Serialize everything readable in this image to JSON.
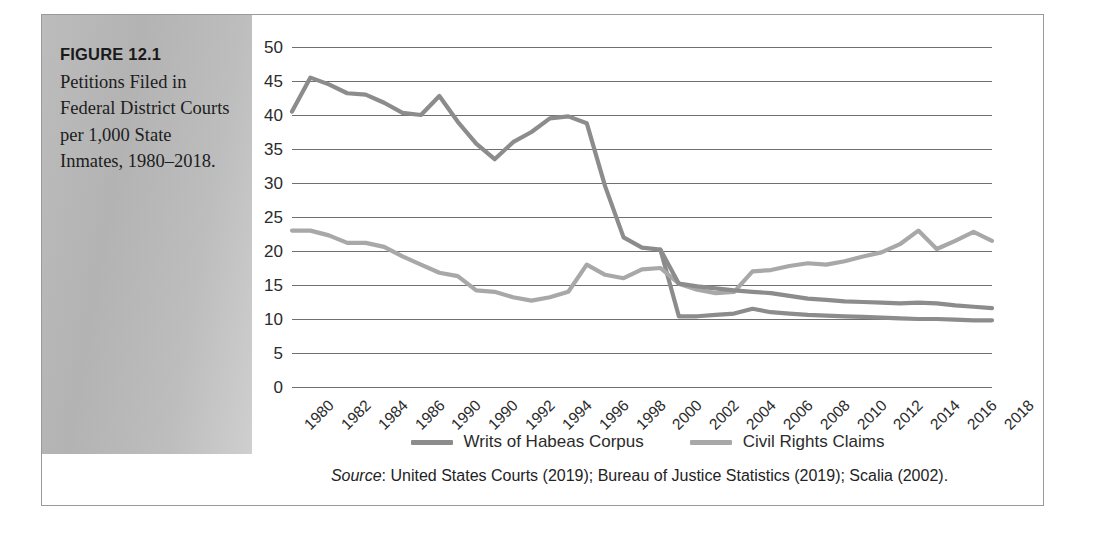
{
  "figure": {
    "number": "FIGURE 12.1",
    "caption": "Petitions Filed in Federal District Courts per 1,000 State Inmates, 1980–2018."
  },
  "source": {
    "label": "Source",
    "text": ": United States Courts (2019); Bureau of Justice Statistics (2019); Scalia (2002)."
  },
  "colors": {
    "habeas": "#8c8c8c",
    "civil_rights": "#a8a8a8",
    "gridline": "#6f6f6f",
    "panel_gray": "#b8b8b8",
    "frame": "#9a9a9a",
    "text": "#2b2b2b"
  },
  "chart_data": {
    "type": "line",
    "xlabel": "",
    "ylabel": "",
    "ylim": [
      0,
      50
    ],
    "ytick_step": 5,
    "yticks": [
      50,
      45,
      40,
      35,
      30,
      25,
      20,
      15,
      10,
      5,
      0
    ],
    "grid": true,
    "legend_position": "bottom",
    "x": [
      1980,
      1981,
      1982,
      1983,
      1984,
      1985,
      1986,
      1987,
      1988,
      1989,
      1990,
      1991,
      1992,
      1993,
      1994,
      1995,
      1996,
      1997,
      1998,
      1999,
      2000,
      2001,
      2002,
      2003,
      2004,
      2005,
      2006,
      2007,
      2008,
      2009,
      2010,
      2011,
      2012,
      2013,
      2014,
      2015,
      2016,
      2017,
      2018
    ],
    "xtick_labels": [
      "1980",
      "1982",
      "1984",
      "1986",
      "1990",
      "1990",
      "1992",
      "1994",
      "1996",
      "1998",
      "2000",
      "2002",
      "2004",
      "2006",
      "2008",
      "2010",
      "2012",
      "2014",
      "2016",
      "2018"
    ],
    "xtick_values": [
      1980,
      1982,
      1984,
      1986,
      1988,
      1990,
      1992,
      1994,
      1996,
      1998,
      2000,
      2002,
      2004,
      2006,
      2008,
      2010,
      2012,
      2014,
      2016,
      2018
    ],
    "series": [
      {
        "name": "Writs of Habeas Corpus",
        "color": "#8c8c8c",
        "values": [
          40.5,
          45.5,
          44.5,
          43.2,
          43.0,
          41.8,
          40.3,
          40.0,
          42.8,
          39.0,
          35.8,
          33.5,
          36.0,
          37.5,
          39.5,
          39.8,
          38.8,
          29.5,
          22.0,
          20.5,
          20.2,
          10.4,
          10.4,
          10.6,
          10.8,
          11.5,
          11.0,
          10.8,
          10.6,
          10.5,
          10.4,
          10.3,
          10.2,
          10.1,
          10.0,
          10.0,
          9.9,
          9.8,
          9.8
        ]
      },
      {
        "name": "Civil Rights Claims",
        "color": "#a8a8a8",
        "values": [
          23.0,
          23.0,
          22.3,
          21.2,
          21.2,
          20.6,
          19.2,
          18.0,
          16.8,
          16.3,
          14.2,
          14.0,
          13.2,
          12.7,
          13.2,
          14.0,
          18.0,
          16.5,
          16.0,
          17.3,
          17.5,
          15.2,
          14.3,
          13.8,
          14.0,
          17.0,
          17.2,
          17.8,
          18.2,
          18.0,
          18.5,
          19.2,
          19.8,
          21.0,
          23.0,
          20.3,
          21.5,
          22.8,
          21.5
        ]
      }
    ],
    "series_alt_late": {
      "note": "post-2000 darker habeas trace",
      "values_2001_2018": [
        15.2,
        14.8,
        14.5,
        14.2,
        14.0,
        13.8,
        13.4,
        13.0,
        12.8,
        12.6,
        12.5,
        12.4,
        12.3,
        12.4,
        12.3,
        12.0,
        11.8,
        11.6
      ]
    }
  }
}
